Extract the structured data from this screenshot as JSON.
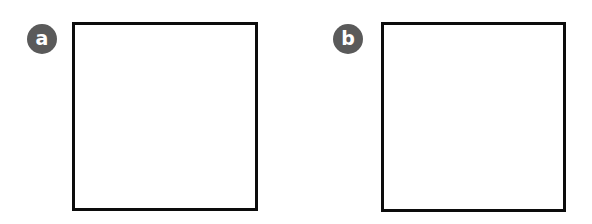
{
  "figure": {
    "background_color": "#ffffff",
    "width": 592,
    "height": 224,
    "panel_count": 2,
    "layout": "two empty bordered panels side by side, each tagged with a circular letter badge"
  },
  "style": {
    "badge_fill_color": "#5a5a5a",
    "badge_text_color": "#ffffff",
    "panel_border_color": "#0c0c0c",
    "panel_fill_color": "#ffffff",
    "panel_border_width_px": 3,
    "badge_diameter_px": 30
  },
  "panels": [
    {
      "id": "a",
      "badge_label": "a",
      "content": "",
      "frame": {
        "x": 72,
        "y": 22,
        "width": 186,
        "height": 189
      },
      "badge": {
        "x": 27,
        "y": 24,
        "diameter": 30
      }
    },
    {
      "id": "b",
      "badge_label": "b",
      "content": "",
      "frame": {
        "x": 381,
        "y": 22,
        "width": 185,
        "height": 190
      },
      "badge": {
        "x": 333,
        "y": 24,
        "diameter": 30
      }
    }
  ]
}
